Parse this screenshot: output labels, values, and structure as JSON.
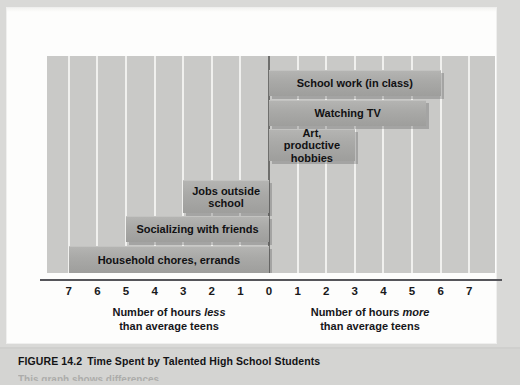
{
  "figure": {
    "number": "FIGURE 14.2",
    "title": "Time Spent by Talented High School Students"
  },
  "axis": {
    "tick_labels_left": [
      "7",
      "6",
      "5",
      "4",
      "3",
      "2",
      "1"
    ],
    "zero_label": "0",
    "tick_labels_right": [
      "1",
      "2",
      "3",
      "4",
      "5",
      "6",
      "7"
    ],
    "caption_left_line1_pre": "Number of hours ",
    "caption_left_line1_em": "less",
    "caption_left_line2": "than average teens",
    "caption_right_line1_pre": "Number of hours ",
    "caption_right_line1_em": "more",
    "caption_right_line2": "than average teens"
  },
  "bars": [
    {
      "label": "School work (in class)",
      "value": 6.0
    },
    {
      "label": "Watching TV",
      "value": 5.5
    },
    {
      "label": "Art, productive\nhobbies",
      "value": 3.0
    },
    {
      "label": "Jobs outside\nschool",
      "value": -3.0
    },
    {
      "label": "Socializing with friends",
      "value": -5.0
    },
    {
      "label": "Household chores, errands",
      "value": -7.0
    }
  ],
  "colors": {
    "plot_background": "#c9c9c7",
    "bar_fill": "#a9a9a7",
    "gridline": "#f2f2f0",
    "axis_line": "#55555a",
    "page_background": "#fdfdfc",
    "caption_band": "#d4d4d2"
  },
  "chart_data": {
    "type": "bar",
    "orientation": "horizontal",
    "title": "Time Spent by Talented High School Students",
    "xlabel": "Number of hours less / more than average teens",
    "ylabel": "",
    "xlim": [
      -7.5,
      7.5
    ],
    "xticks": [
      -7,
      -6,
      -5,
      -4,
      -3,
      -2,
      -1,
      0,
      1,
      2,
      3,
      4,
      5,
      6,
      7
    ],
    "xticklabels": [
      "7",
      "6",
      "5",
      "4",
      "3",
      "2",
      "1",
      "0",
      "1",
      "2",
      "3",
      "4",
      "5",
      "6",
      "7"
    ],
    "grid": true,
    "legend": "none",
    "categories": [
      "School work (in class)",
      "Watching TV",
      "Art, productive hobbies",
      "Jobs outside school",
      "Socializing with friends",
      "Household chores, errands"
    ],
    "values": [
      6.0,
      5.5,
      3.0,
      -3.0,
      -5.0,
      -7.0
    ],
    "units": "hours per week relative to average teens",
    "annotations": [
      "Left side of zero = number of hours less than average teens",
      "Right side of zero = number of hours more than average teens"
    ]
  }
}
